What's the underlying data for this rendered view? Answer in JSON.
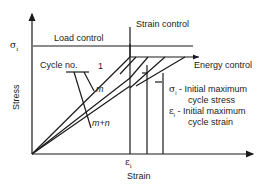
{
  "diagram": {
    "title_cut": "...",
    "x_axis_label": "Strain",
    "y_axis_label": "Stress",
    "y_tick": "σ",
    "y_tick_sub": "i",
    "x_tick": "ε",
    "x_tick_sub": "i",
    "labels": {
      "load_control": "Load control",
      "strain_control": "Strain control",
      "energy_control": "Energy control",
      "cycle_no": "Cycle no.",
      "cycle_1": "1",
      "cycle_m": "m",
      "cycle_mn": "m+n"
    },
    "legend": [
      {
        "symbol": "σ",
        "sub": "i",
        "text_line1": "- Initial maximum",
        "text_line2": "cycle stress"
      },
      {
        "symbol": "ε",
        "sub": "i",
        "text_line1": "- Initial maximum",
        "text_line2": "cycle strain"
      }
    ],
    "colors": {
      "line": "#1a1a1a",
      "background": "#ffffff"
    }
  }
}
